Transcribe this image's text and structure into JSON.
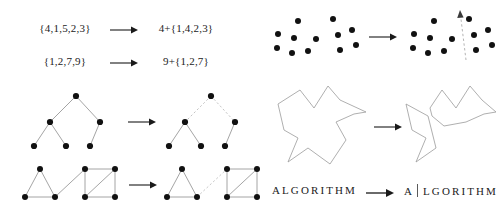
{
  "figure": {
    "background_color": "#ffffff",
    "ink_color": "#1a1a1a",
    "dashed_color": "#b0b0b0",
    "outline_color": "#8e8e8e"
  },
  "panels": {
    "set_partition": {
      "name": "set-partition-panel",
      "rows": [
        {
          "lhs": "{4,1,5,2,3}",
          "rhs": "4+{1,4,2,3}",
          "arrow": "right-arrow"
        },
        {
          "lhs": "{1,2,7,9}",
          "rhs": "9+{1,2,7}",
          "arrow": "right-arrow"
        }
      ]
    },
    "tree_split": {
      "name": "tree-edge-removal-panel",
      "arrow": "right-arrow",
      "before": {
        "label": "connected-tree",
        "nodes": [
          {
            "id": "root",
            "x": 48,
            "y": 6
          },
          {
            "id": "left",
            "x": 22,
            "y": 32
          },
          {
            "id": "right",
            "x": 72,
            "y": 32
          },
          {
            "id": "leaf1",
            "x": 6,
            "y": 56
          },
          {
            "id": "leaf2",
            "x": 38,
            "y": 56
          },
          {
            "id": "leaf3",
            "x": 62,
            "y": 56
          }
        ],
        "edges": [
          {
            "from": "root",
            "to": "left",
            "style": "solid"
          },
          {
            "from": "root",
            "to": "right",
            "style": "solid"
          },
          {
            "from": "left",
            "to": "leaf1",
            "style": "solid"
          },
          {
            "from": "left",
            "to": "leaf2",
            "style": "solid"
          },
          {
            "from": "right",
            "to": "leaf3",
            "style": "solid"
          }
        ]
      },
      "after": {
        "label": "tree-with-root-edges-cut",
        "nodes": [
          {
            "id": "root",
            "x": 48,
            "y": 6
          },
          {
            "id": "left",
            "x": 22,
            "y": 32
          },
          {
            "id": "right",
            "x": 72,
            "y": 32
          },
          {
            "id": "leaf1",
            "x": 6,
            "y": 56
          },
          {
            "id": "leaf2",
            "x": 38,
            "y": 56
          },
          {
            "id": "leaf3",
            "x": 62,
            "y": 56
          }
        ],
        "edges": [
          {
            "from": "root",
            "to": "left",
            "style": "dashed"
          },
          {
            "from": "root",
            "to": "right",
            "style": "dashed"
          },
          {
            "from": "left",
            "to": "leaf1",
            "style": "solid"
          },
          {
            "from": "left",
            "to": "leaf2",
            "style": "solid"
          },
          {
            "from": "right",
            "to": "leaf3",
            "style": "solid"
          }
        ]
      }
    },
    "graph_split": {
      "name": "graph-bridge-removal-panel",
      "arrow": "right-arrow",
      "before": {
        "label": "triangle-bridge-square",
        "nodes": [
          {
            "id": "t_apex",
            "x": 18,
            "y": 4
          },
          {
            "id": "t_bl",
            "x": 3,
            "y": 32
          },
          {
            "id": "t_br",
            "x": 33,
            "y": 32
          },
          {
            "id": "s_tl",
            "x": 63,
            "y": 4
          },
          {
            "id": "s_tr",
            "x": 93,
            "y": 4
          },
          {
            "id": "s_bl",
            "x": 63,
            "y": 32
          },
          {
            "id": "s_br",
            "x": 93,
            "y": 32
          }
        ],
        "edges": [
          {
            "from": "t_apex",
            "to": "t_bl",
            "style": "solid"
          },
          {
            "from": "t_apex",
            "to": "t_br",
            "style": "solid"
          },
          {
            "from": "t_bl",
            "to": "t_br",
            "style": "solid"
          },
          {
            "from": "t_br",
            "to": "s_tl",
            "style": "solid"
          },
          {
            "from": "s_tl",
            "to": "s_tr",
            "style": "solid"
          },
          {
            "from": "s_tl",
            "to": "s_bl",
            "style": "solid"
          },
          {
            "from": "s_tr",
            "to": "s_br",
            "style": "solid"
          },
          {
            "from": "s_bl",
            "to": "s_br",
            "style": "solid"
          },
          {
            "from": "s_bl",
            "to": "s_tr",
            "style": "solid"
          }
        ]
      },
      "after": {
        "label": "triangle-square-bridge-cut",
        "nodes": [
          {
            "id": "t_apex",
            "x": 18,
            "y": 4
          },
          {
            "id": "t_bl",
            "x": 3,
            "y": 32
          },
          {
            "id": "t_br",
            "x": 33,
            "y": 32
          },
          {
            "id": "s_tl",
            "x": 63,
            "y": 4
          },
          {
            "id": "s_tr",
            "x": 93,
            "y": 4
          },
          {
            "id": "s_bl",
            "x": 63,
            "y": 32
          },
          {
            "id": "s_br",
            "x": 93,
            "y": 32
          }
        ],
        "edges": [
          {
            "from": "t_apex",
            "to": "t_bl",
            "style": "solid"
          },
          {
            "from": "t_apex",
            "to": "t_br",
            "style": "solid"
          },
          {
            "from": "t_bl",
            "to": "t_br",
            "style": "solid"
          },
          {
            "from": "t_br",
            "to": "s_tl",
            "style": "dashed"
          },
          {
            "from": "s_tl",
            "to": "s_tr",
            "style": "solid"
          },
          {
            "from": "s_tl",
            "to": "s_bl",
            "style": "solid"
          },
          {
            "from": "s_tr",
            "to": "s_br",
            "style": "solid"
          },
          {
            "from": "s_bl",
            "to": "s_br",
            "style": "solid"
          },
          {
            "from": "s_bl",
            "to": "s_tr",
            "style": "solid"
          }
        ]
      }
    },
    "point_cloud_split": {
      "name": "point-set-separation-panel",
      "arrow": "right-arrow",
      "before": {
        "label": "unseparated-point-cloud",
        "points": [
          {
            "x": 10,
            "y": 26
          },
          {
            "x": 9,
            "y": 40
          },
          {
            "x": 26,
            "y": 30
          },
          {
            "x": 30,
            "y": 13
          },
          {
            "x": 24,
            "y": 45
          },
          {
            "x": 40,
            "y": 43
          },
          {
            "x": 48,
            "y": 31
          },
          {
            "x": 65,
            "y": 11
          },
          {
            "x": 70,
            "y": 27
          },
          {
            "x": 84,
            "y": 22
          },
          {
            "x": 72,
            "y": 42
          },
          {
            "x": 88,
            "y": 37
          }
        ]
      },
      "after": {
        "label": "separated-point-cloud",
        "points": [
          {
            "x": 10,
            "y": 26
          },
          {
            "x": 9,
            "y": 40
          },
          {
            "x": 26,
            "y": 30
          },
          {
            "x": 30,
            "y": 13
          },
          {
            "x": 24,
            "y": 45
          },
          {
            "x": 40,
            "y": 43
          },
          {
            "x": 48,
            "y": 31
          },
          {
            "x": 65,
            "y": 11
          },
          {
            "x": 70,
            "y": 27
          },
          {
            "x": 84,
            "y": 22
          },
          {
            "x": 72,
            "y": 42
          },
          {
            "x": 88,
            "y": 37
          }
        ],
        "separator": {
          "label": "dashed-separator-line",
          "style": "dashed",
          "arrowhead": "top",
          "x1": 62,
          "y1": 52,
          "x2": 56,
          "y2": 3
        }
      }
    },
    "polygon_split": {
      "name": "polygon-partition-panel",
      "arrow": "right-arrow",
      "before": {
        "label": "single-polygon",
        "outline": "8,18 30,4 44,22 58,0 70,14 96,26 84,28 66,36 76,54 60,78 38,62 18,76 28,52 14,44"
      },
      "after": {
        "label": "split-polygon-pieces",
        "piece_left": "8,18 30,30 38,62 18,76 28,52 14,44",
        "piece_right": "32,22 44,4 58,22 72,0 84,14 98,26 86,28 68,36 46,40 34,30"
      }
    },
    "string_split": {
      "name": "string-split-panel",
      "arrow": "right-arrow",
      "before": "ALGORITHM",
      "after_head": "A",
      "after_tail": "LGORITHM",
      "divider": "vertical-bar"
    }
  }
}
